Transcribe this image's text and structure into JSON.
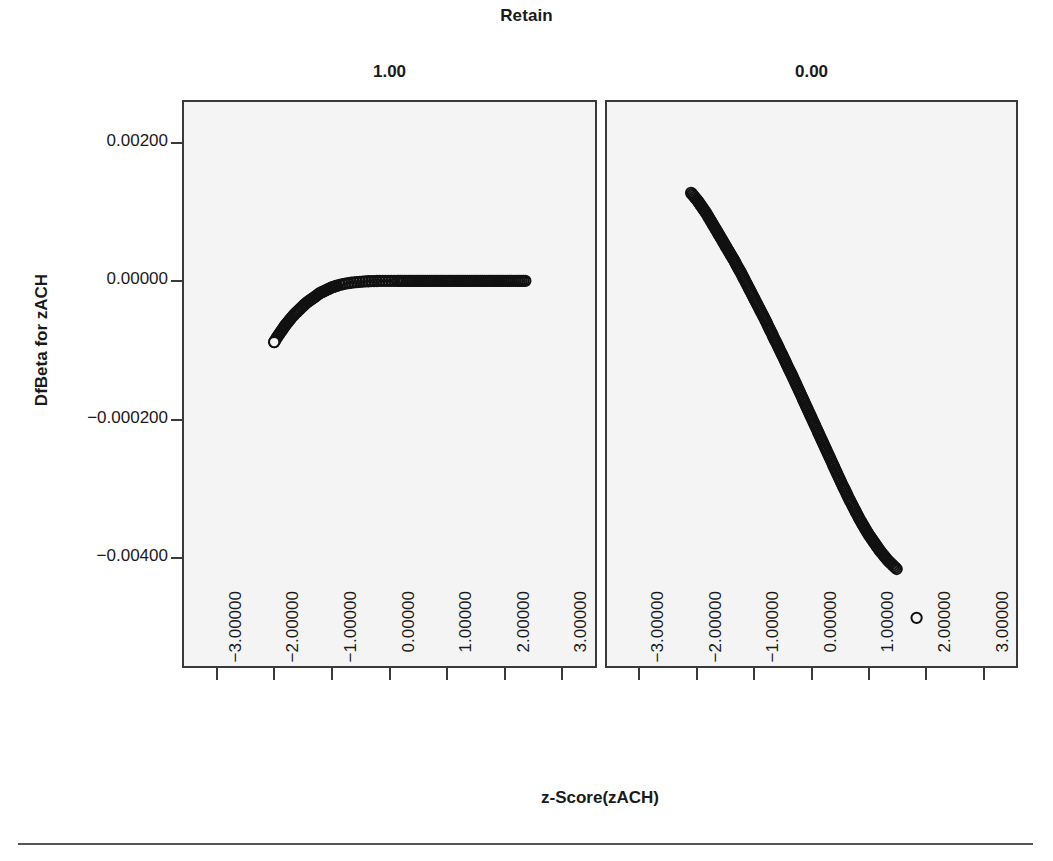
{
  "chart_data": {
    "type": "scatter",
    "title": "Retain",
    "xlabel": "z-Score(zACH)",
    "ylabel": "DfBeta for zACH",
    "grid": false,
    "legend": "none",
    "xlim": [
      -3.6,
      3.6
    ],
    "ylim": [
      -0.0056,
      0.0026
    ],
    "xticks": [
      -3,
      -2,
      -1,
      0,
      1,
      2,
      3
    ],
    "xtick_labels": [
      "-3.00000",
      "-2.00000",
      "-1.00000",
      "0.00000",
      "1.00000",
      "2.00000",
      "3.00000"
    ],
    "yticks": [
      0.002,
      0.0,
      -0.002,
      -0.004
    ],
    "ytick_labels": [
      "0.00200",
      "0.00000",
      "-0.000200",
      "-0.00400"
    ],
    "marker": "open-circle",
    "marker_color": "#111111",
    "panel_background": "#f4f4f4",
    "panels": [
      {
        "label": "1.00",
        "name": "retain-1",
        "points": [
          [
            -2.02,
            -0.00089
          ],
          [
            -1.97,
            -0.00082
          ],
          [
            -1.92,
            -0.00076
          ],
          [
            -1.87,
            -0.0007
          ],
          [
            -1.82,
            -0.00064
          ],
          [
            -1.77,
            -0.00059
          ],
          [
            -1.72,
            -0.00054
          ],
          [
            -1.67,
            -0.00049
          ],
          [
            -1.62,
            -0.00045
          ],
          [
            -1.57,
            -0.00041
          ],
          [
            -1.52,
            -0.00037
          ],
          [
            -1.47,
            -0.00033
          ],
          [
            -1.42,
            -0.0003
          ],
          [
            -1.37,
            -0.00027
          ],
          [
            -1.32,
            -0.00024
          ],
          [
            -1.27,
            -0.00021
          ],
          [
            -1.22,
            -0.00018
          ],
          [
            -1.17,
            -0.00016
          ],
          [
            -1.12,
            -0.00014
          ],
          [
            -1.07,
            -0.00012
          ],
          [
            -1.02,
            -0.0001
          ],
          [
            -0.97,
            -8.5e-05
          ],
          [
            -0.92,
            -7.2e-05
          ],
          [
            -0.87,
            -6e-05
          ],
          [
            -0.82,
            -5e-05
          ],
          [
            -0.77,
            -4.1e-05
          ],
          [
            -0.72,
            -3.4e-05
          ],
          [
            -0.67,
            -2.8e-05
          ],
          [
            -0.62,
            -2.2e-05
          ],
          [
            -0.57,
            -1.8e-05
          ],
          [
            -0.52,
            -1.4e-05
          ],
          [
            -0.47,
            -1.1e-05
          ],
          [
            -0.42,
            -8.5e-06
          ],
          [
            -0.37,
            -6.5e-06
          ],
          [
            -0.32,
            -4.8e-06
          ],
          [
            -0.27,
            -3.5e-06
          ],
          [
            -0.22,
            -2.5e-06
          ],
          [
            -0.17,
            -1.7e-06
          ],
          [
            -0.12,
            -1.1e-06
          ],
          [
            -0.07,
            -7e-07
          ],
          [
            -0.02,
            -4e-07
          ],
          [
            0.03,
            -2e-07
          ],
          [
            0.08,
            -1e-07
          ],
          [
            0.13,
            0.0
          ],
          [
            0.3,
            0.0
          ],
          [
            0.5,
            0.0
          ],
          [
            0.7,
            0.0
          ],
          [
            0.9,
            0.0
          ],
          [
            1.1,
            0.0
          ],
          [
            1.3,
            0.0
          ],
          [
            1.5,
            0.0
          ],
          [
            1.7,
            0.0
          ],
          [
            1.9,
            0.0
          ],
          [
            2.1,
            0.0
          ],
          [
            2.25,
            0.0
          ],
          [
            2.38,
            0.0
          ]
        ],
        "endpoint_outlier": [
          -2.02,
          -0.00089
        ]
      },
      {
        "label": "0.00",
        "name": "retain-0",
        "points": [
          [
            -2.12,
            0.00128
          ],
          [
            -2.08,
            0.00124
          ],
          [
            -2.04,
            0.0012
          ],
          [
            -2.0,
            0.00116
          ],
          [
            -1.95,
            0.0011
          ],
          [
            -1.9,
            0.00104
          ],
          [
            -1.85,
            0.00098
          ],
          [
            -1.8,
            0.00091
          ],
          [
            -1.75,
            0.00084
          ],
          [
            -1.7,
            0.00077
          ],
          [
            -1.65,
            0.0007
          ],
          [
            -1.6,
            0.00063
          ],
          [
            -1.55,
            0.00056
          ],
          [
            -1.5,
            0.00049
          ],
          [
            -1.45,
            0.00042
          ],
          [
            -1.4,
            0.00035
          ],
          [
            -1.35,
            0.00028
          ],
          [
            -1.3,
            0.0002
          ],
          [
            -1.25,
            0.00013
          ],
          [
            -1.2,
            5e-05
          ],
          [
            -1.15,
            -3e-05
          ],
          [
            -1.1,
            -0.00011
          ],
          [
            -1.05,
            -0.00019
          ],
          [
            -1.0,
            -0.00027
          ],
          [
            -0.95,
            -0.00035
          ],
          [
            -0.9,
            -0.00043
          ],
          [
            -0.85,
            -0.00051
          ],
          [
            -0.8,
            -0.00059
          ],
          [
            -0.75,
            -0.00068
          ],
          [
            -0.7,
            -0.00076
          ],
          [
            -0.65,
            -0.00085
          ],
          [
            -0.6,
            -0.00093
          ],
          [
            -0.55,
            -0.00102
          ],
          [
            -0.5,
            -0.0011
          ],
          [
            -0.45,
            -0.00119
          ],
          [
            -0.4,
            -0.00128
          ],
          [
            -0.35,
            -0.00136
          ],
          [
            -0.3,
            -0.00145
          ],
          [
            -0.25,
            -0.00154
          ],
          [
            -0.2,
            -0.00163
          ],
          [
            -0.15,
            -0.00172
          ],
          [
            -0.1,
            -0.00181
          ],
          [
            -0.05,
            -0.0019
          ],
          [
            0.0,
            -0.00199
          ],
          [
            0.05,
            -0.00208
          ],
          [
            0.1,
            -0.00217
          ],
          [
            0.15,
            -0.00226
          ],
          [
            0.2,
            -0.00235
          ],
          [
            0.25,
            -0.00244
          ],
          [
            0.3,
            -0.00253
          ],
          [
            0.35,
            -0.00262
          ],
          [
            0.4,
            -0.00271
          ],
          [
            0.45,
            -0.0028
          ],
          [
            0.5,
            -0.00289
          ],
          [
            0.55,
            -0.00298
          ],
          [
            0.6,
            -0.00306
          ],
          [
            0.65,
            -0.00315
          ],
          [
            0.7,
            -0.00323
          ],
          [
            0.75,
            -0.00331
          ],
          [
            0.8,
            -0.00339
          ],
          [
            0.85,
            -0.00347
          ],
          [
            0.9,
            -0.00354
          ],
          [
            0.95,
            -0.00361
          ],
          [
            1.0,
            -0.00368
          ],
          [
            1.05,
            -0.00374
          ],
          [
            1.1,
            -0.0038
          ],
          [
            1.15,
            -0.00386
          ],
          [
            1.2,
            -0.00392
          ],
          [
            1.25,
            -0.00397
          ],
          [
            1.3,
            -0.00402
          ],
          [
            1.35,
            -0.00407
          ],
          [
            1.4,
            -0.00411
          ],
          [
            1.45,
            -0.00415
          ],
          [
            1.5,
            -0.00419
          ]
        ],
        "endpoint_outlier": [
          1.85,
          -0.0049
        ]
      }
    ]
  }
}
